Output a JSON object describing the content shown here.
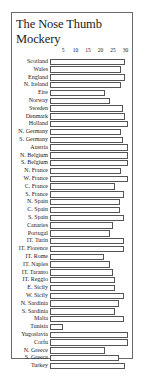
{
  "chart_data": {
    "type": "bar",
    "orientation": "horizontal",
    "title": "The Nose Thumb Mockery",
    "xlabel": "",
    "ylabel": "",
    "xlim": [
      0,
      31
    ],
    "ticks": [
      5,
      10,
      15,
      20,
      25,
      30
    ],
    "grid": false,
    "legend": null,
    "categories": [
      "Scotland",
      "Wales",
      "England",
      "N. Ireland",
      "Eire",
      "Norway",
      "Sweden",
      "Denmark",
      "Holland",
      "N. Germany",
      "S. Germany",
      "Austria",
      "N. Belgium",
      "S. Belgium",
      "N. France",
      "W. France",
      "C. France",
      "S. France",
      "N. Spain",
      "C. Spain",
      "S. Spain",
      "Canaries",
      "Portugal",
      "IT. Turin",
      "IT. Florence",
      "IT. Rome",
      "IT. Naples",
      "IT. Taranto",
      "IT. Reggio",
      "E. Sicily",
      "W. Sicily",
      "N. Sardinia",
      "S. Sardinia",
      "Malta",
      "Tunisia",
      "Yugoslavia",
      "Corfu",
      "N. Greece",
      "S. Greece",
      "Turkey"
    ],
    "values": [
      30,
      28.5,
      30,
      28.5,
      22,
      24,
      29,
      30,
      31,
      28.5,
      29,
      31,
      31,
      31,
      28.5,
      31,
      26,
      29.5,
      28,
      28,
      29.5,
      25,
      24,
      29.5,
      29.5,
      21.5,
      24,
      25,
      26,
      26,
      29.5,
      27.5,
      26,
      29.5,
      5,
      31,
      31,
      22,
      27.5,
      30
    ]
  },
  "colors": {
    "bar_fill": "#ffffff",
    "bar_border": "#555555",
    "frame": "#6a6a6a",
    "text": "#1a1a1a"
  }
}
